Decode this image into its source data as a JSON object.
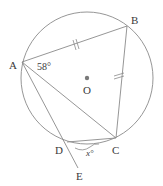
{
  "diagram": {
    "type": "circle-geometry",
    "colors": {
      "line": "#8a8a8a",
      "text": "#3a3a3a",
      "center_dot": "#7a7a7a"
    },
    "circle": {
      "center": "O",
      "cx": 87,
      "cy": 78,
      "r": 66
    },
    "points": {
      "A": {
        "label": "A",
        "x": 22,
        "y": 62
      },
      "B": {
        "label": "B",
        "x": 127,
        "y": 26
      },
      "C": {
        "label": "C",
        "x": 116,
        "y": 138
      },
      "D": {
        "label": "D",
        "x": 67,
        "y": 142
      },
      "E": {
        "label": "E",
        "x": 78,
        "y": 168
      },
      "O": {
        "label": "O",
        "x": 87,
        "y": 78
      }
    },
    "segments": [
      "AB",
      "BC",
      "AC",
      "AD",
      "DC",
      "DE"
    ],
    "equal_marks": [
      "AB",
      "BC"
    ],
    "angles": [
      {
        "at": "A",
        "label": "58°"
      },
      {
        "at": "D",
        "between": "EDC",
        "label": "x°"
      }
    ]
  }
}
